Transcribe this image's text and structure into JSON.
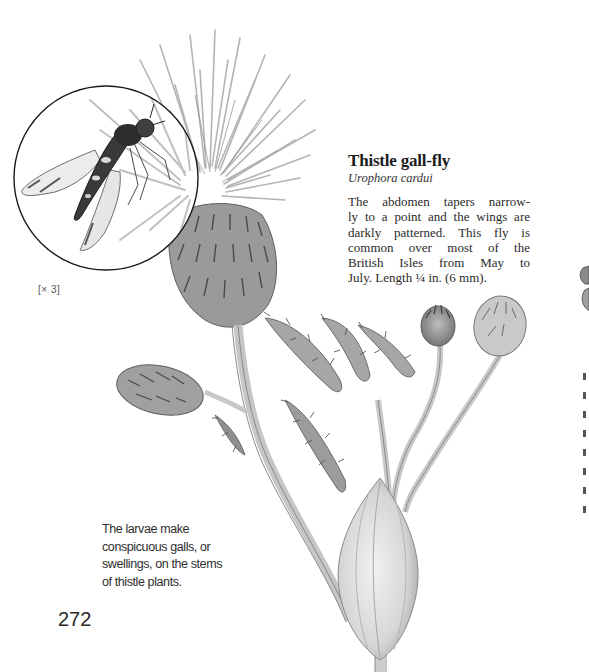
{
  "page": {
    "number": "272"
  },
  "entry": {
    "title": "Thistle gall-fly",
    "latin_name": "Urophora cardui",
    "description_lines": [
      "The abdomen tapers narrow-",
      "ly to a point and the wings are",
      "darkly patterned. This fly is",
      "common over most of the",
      "British Isles from May to",
      "July. Length ¼ in. (6 mm)."
    ]
  },
  "inset": {
    "magnification_label": "[× 3]",
    "subject": "fly-magnified-icon"
  },
  "caption": {
    "lines": [
      "The larvae make",
      "conspicuous galls, or",
      "swellings, on the stems",
      "of thistle plants."
    ]
  },
  "illustration": {
    "subject": "thistle-plant-with-gall",
    "colors": {
      "ink": "#1c1c1c",
      "pencil_dark": "#6a6a6a",
      "pencil_mid": "#9a9a9a",
      "pencil_light": "#c8c8c8",
      "paper": "#ffffff"
    }
  }
}
